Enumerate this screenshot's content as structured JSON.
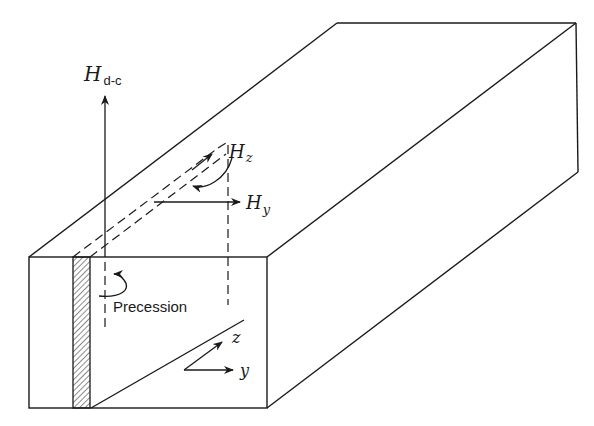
{
  "diagram": {
    "type": "ferrite-slab-in-waveguide",
    "labels": {
      "h_dc_main": "H",
      "h_dc_sub": "d-c",
      "h_z_main": "H",
      "h_z_sub": "z",
      "h_y_main": "H",
      "h_y_sub": "y",
      "precession": "Precession",
      "axis_z": "z",
      "axis_y": "y"
    },
    "colors": {
      "ink": "#1a1a1a",
      "background": "#ffffff"
    }
  }
}
